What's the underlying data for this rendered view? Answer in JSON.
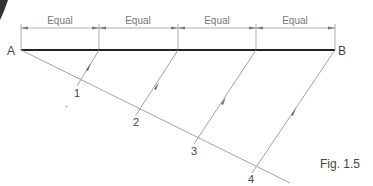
{
  "diagram": {
    "point_labels": {
      "start": "A",
      "end": "B"
    },
    "segment_labels": [
      "Equal",
      "Equal",
      "Equal",
      "Equal"
    ],
    "division_labels": [
      "1",
      "2",
      "3",
      "4"
    ],
    "caption": "Fig. 1.5",
    "colors": {
      "main_line": "#222222",
      "construction": "#999999",
      "text": "#444444"
    }
  }
}
